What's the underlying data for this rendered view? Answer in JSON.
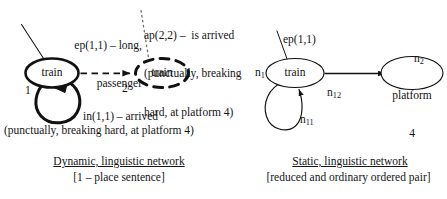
{
  "figure": {
    "background_color": "#ffffff",
    "ink_color": "#111111",
    "width": 447,
    "height": 199
  },
  "left_panel": {
    "name": "dynamic-linguistic-network",
    "annotations": {
      "ep_label_line1": "ep(1,1) – long,",
      "ep_label_line2": "passenger",
      "ap_label_line1": "ap(2,2) –  is arrived",
      "ap_label_line2": "(punctually, breaking",
      "ap_label_line3": "hard, at platform 4)",
      "in_label_line1": "in(1,1) – arrived",
      "in_label_line2": "(punctually, breaking hard, at platform 4)"
    },
    "nodes": [
      {
        "id": "node-1",
        "text": "train",
        "index": "1",
        "style": "thick-solid"
      },
      {
        "id": "node-2",
        "text": "train",
        "index": "2",
        "style": "thick-dashed"
      }
    ],
    "caption": {
      "title": "Dynamic, linguistic network",
      "subtitle": "[1 – place sentence]"
    }
  },
  "right_panel": {
    "name": "static-linguistic-network",
    "annotations": {
      "ep_label": "ep(1,1)"
    },
    "nodes": [
      {
        "id": "node-n1",
        "text": "train",
        "index": "n",
        "index_sub": "1",
        "style": "thin-solid"
      },
      {
        "id": "node-n2",
        "text_line1": "platform",
        "text_line2": "4",
        "index": "n",
        "index_sub": "2",
        "style": "thin-solid"
      }
    ],
    "edges": [
      {
        "id": "edge-n11",
        "label_base": "n",
        "label_sub": "11",
        "kind": "self-loop"
      },
      {
        "id": "edge-n12",
        "label_base": "n",
        "label_sub": "12",
        "kind": "directed"
      }
    ],
    "caption": {
      "title": "Static, linguistic network",
      "subtitle": "[reduced and ordinary ordered pair]"
    }
  }
}
